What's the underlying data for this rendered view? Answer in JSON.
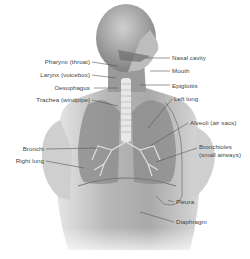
{
  "diagram": {
    "labels_left": [
      {
        "id": "pharynx",
        "text": "Pharynx (throat)"
      },
      {
        "id": "larynx",
        "text": "Larynx (voicebox)"
      },
      {
        "id": "oesophagus",
        "text": "Oesophagus"
      },
      {
        "id": "trachea",
        "text": "Trachea (windpipe)"
      },
      {
        "id": "bronchi",
        "text": "Bronchi"
      },
      {
        "id": "right-lung",
        "text": "Right lung"
      }
    ],
    "labels_right": [
      {
        "id": "nasal-cavity",
        "text": "Nasal cavity"
      },
      {
        "id": "mouth",
        "text": "Mouth"
      },
      {
        "id": "epiglottis",
        "text": "Epiglottis"
      },
      {
        "id": "left-lung",
        "text": "Left lung"
      },
      {
        "id": "alveoli",
        "text": "Alveoli (air sacs)"
      },
      {
        "id": "bronchioles-1",
        "text": "Bronchioles"
      },
      {
        "id": "bronchioles-2",
        "text": "(small airways)"
      },
      {
        "id": "pleura",
        "text": "Pleura"
      },
      {
        "id": "diaphragm",
        "text": "Diaphragm"
      }
    ],
    "colors": {
      "background": "#ffffff",
      "skin_light": "#d9d9d9",
      "skin_dark": "#8a8a8a",
      "label_text": "#444444",
      "leader_line": "#555555"
    }
  }
}
